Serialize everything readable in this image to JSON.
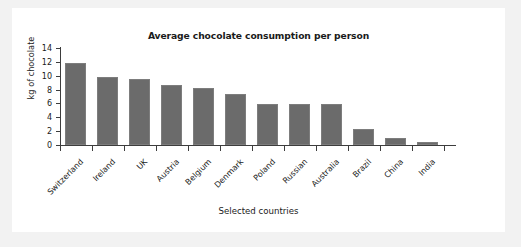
{
  "figure": {
    "background_color": "#ffffff",
    "page_background_color": "#f2f2f2",
    "bar_color": "#6b6b6b",
    "axis_color": "#3d3d3d",
    "text_color": "#1a1a1a"
  },
  "chart_data": {
    "type": "bar",
    "title": "Average chocolate consumption per person",
    "xlabel": "Selected countries",
    "ylabel": "kg of chocolate",
    "categories": [
      "Switzerland",
      "Ireland",
      "UK",
      "Austria",
      "Belgium",
      "Denmark",
      "Poland",
      "Russian",
      "Australia",
      "Brazil",
      "China",
      "India"
    ],
    "values": [
      11.8,
      9.8,
      9.5,
      8.7,
      8.2,
      7.35,
      5.9,
      5.85,
      5.85,
      2.3,
      1.0,
      0.45
    ],
    "ylim": [
      0,
      14
    ],
    "ytick_labels": [
      "0",
      "2",
      "4",
      "6",
      "8",
      "10",
      "12",
      "14"
    ],
    "ytick_values": [
      0,
      2,
      4,
      6,
      8,
      10,
      12,
      14
    ],
    "grid": false,
    "legend": null,
    "series_name": "kg of chocolate"
  }
}
